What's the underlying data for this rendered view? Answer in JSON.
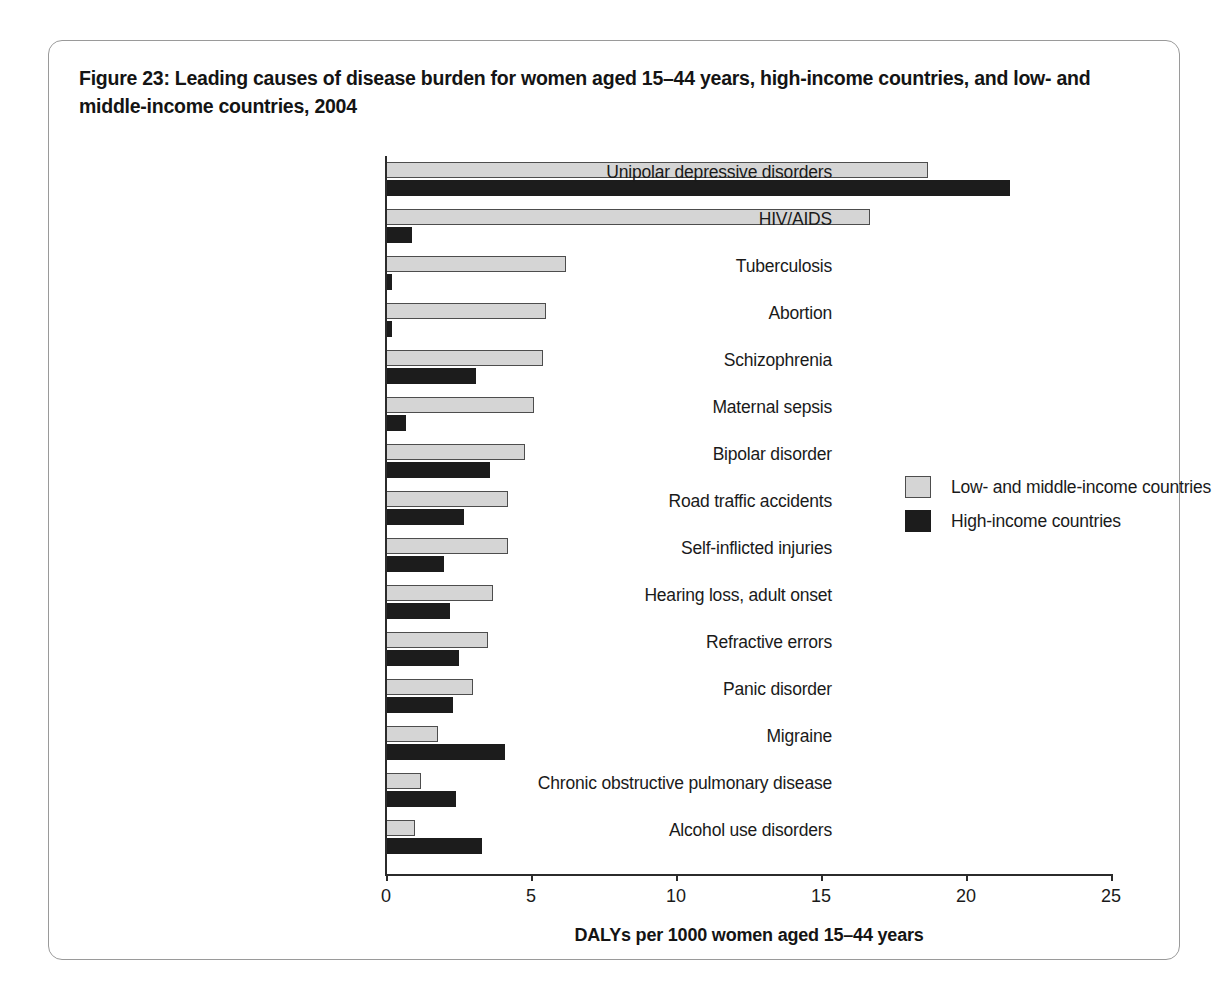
{
  "figure": {
    "title": "Figure 23: Leading causes of disease burden for women aged 15–44 years, high-income countries, and low- and middle-income countries, 2004"
  },
  "chart_data": {
    "type": "bar",
    "orientation": "horizontal",
    "title": "Figure 23: Leading causes of disease burden for women aged 15–44 years, high-income countries, and low- and middle-income countries, 2004",
    "xlabel": "DALYs per 1000 women aged 15–44 years",
    "ylabel": "",
    "xlim": [
      0,
      25
    ],
    "xticks": [
      0,
      5,
      10,
      15,
      20,
      25
    ],
    "xtick_labels": [
      "0",
      "5",
      "10",
      "15",
      "20",
      "25"
    ],
    "grid": false,
    "legend_position": "middle-right",
    "categories": [
      "Unipolar depressive disorders",
      "HIV/AIDS",
      "Tuberculosis",
      "Abortion",
      "Schizophrenia",
      "Maternal sepsis",
      "Bipolar disorder",
      "Road traffic accidents",
      "Self-inflicted injuries",
      "Hearing loss, adult onset",
      "Refractive errors",
      "Panic disorder",
      "Migraine",
      "Chronic obstructive pulmonary disease",
      "Alcohol use disorders"
    ],
    "series": [
      {
        "name": "Low- and middle-income countries",
        "color": "#d5d5d5",
        "values": [
          18.7,
          16.7,
          6.2,
          5.5,
          5.4,
          5.1,
          4.8,
          4.2,
          4.2,
          3.7,
          3.5,
          3.0,
          1.8,
          1.2,
          1.0
        ]
      },
      {
        "name": "High-income countries",
        "color": "#1c1c1c",
        "values": [
          21.5,
          0.9,
          0.2,
          0.2,
          3.1,
          0.7,
          3.6,
          2.7,
          2.0,
          2.2,
          2.5,
          2.3,
          4.1,
          2.4,
          3.3
        ]
      }
    ]
  },
  "legend": {
    "items": [
      {
        "label": "Low- and middle-income countries"
      },
      {
        "label": "High-income countries"
      }
    ]
  }
}
